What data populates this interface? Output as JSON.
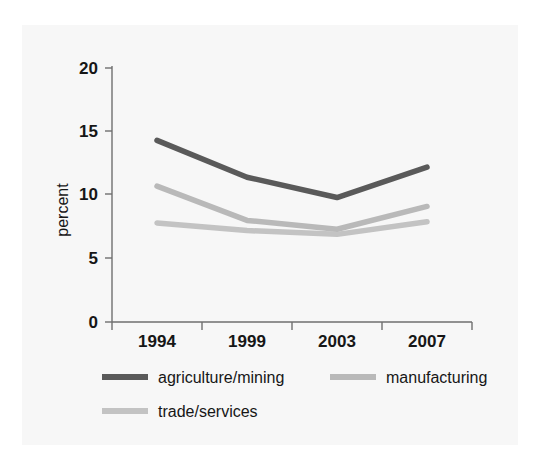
{
  "chart_data": {
    "type": "line",
    "title": "",
    "subtitle": "",
    "xlabel": "",
    "ylabel": "percent",
    "categories": [
      "1994",
      "1999",
      "2003",
      "2007"
    ],
    "x": [
      1994,
      1999,
      2003,
      2007
    ],
    "ylim": [
      0,
      20
    ],
    "yticks": [
      0,
      5,
      10,
      15,
      20
    ],
    "ytick_labels": [
      "0",
      "5",
      "10",
      "15",
      "20"
    ],
    "grid": false,
    "legend_position": "bottom",
    "series": [
      {
        "name": "agriculture/mining",
        "color": "#5a5a5a",
        "values": [
          14.3,
          11.4,
          9.8,
          12.2
        ]
      },
      {
        "name": "manufacturing",
        "color": "#b9b9b9",
        "values": [
          10.7,
          8.0,
          7.3,
          9.1
        ]
      },
      {
        "name": "trade/services",
        "color": "#c3c3c3",
        "values": [
          7.8,
          7.2,
          6.9,
          7.9
        ]
      }
    ]
  },
  "axis": {
    "y_title": "percent",
    "y_tick_0": "0",
    "y_tick_1": "5",
    "y_tick_2": "10",
    "y_tick_3": "15",
    "y_tick_4": "20",
    "x_tick_0": "1994",
    "x_tick_1": "1999",
    "x_tick_2": "2003",
    "x_tick_3": "2007"
  },
  "legend": {
    "item_0_label": "agriculture/mining",
    "item_1_label": "manufacturing",
    "item_2_label": "trade/services",
    "item_0_color": "#5a5a5a",
    "item_1_color": "#b9b9b9",
    "item_2_color": "#c3c3c3"
  },
  "colors": {
    "background": "#ffffff",
    "panel": "#f7f7f7",
    "axis": "#6f6f6f",
    "text": "#161616"
  }
}
